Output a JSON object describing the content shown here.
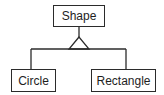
{
  "diagram": {
    "type": "uml-class-inheritance",
    "nodes": [
      {
        "id": "shape",
        "label": "Shape",
        "role": "parent",
        "box": [
          53,
          5,
          52,
          22
        ]
      },
      {
        "id": "circle",
        "label": "Circle",
        "role": "child",
        "box": [
          11,
          69,
          45,
          23
        ]
      },
      {
        "id": "rectangle",
        "label": "Rectangle",
        "role": "child",
        "box": [
          91,
          69,
          65,
          23
        ]
      }
    ],
    "edges": [
      {
        "from": "circle",
        "to": "shape",
        "type": "generalization"
      },
      {
        "from": "rectangle",
        "to": "shape",
        "type": "generalization"
      }
    ],
    "colors": {
      "line": "#2b2b2b",
      "text": "#1e1e1e",
      "background": "#ffffff"
    }
  }
}
